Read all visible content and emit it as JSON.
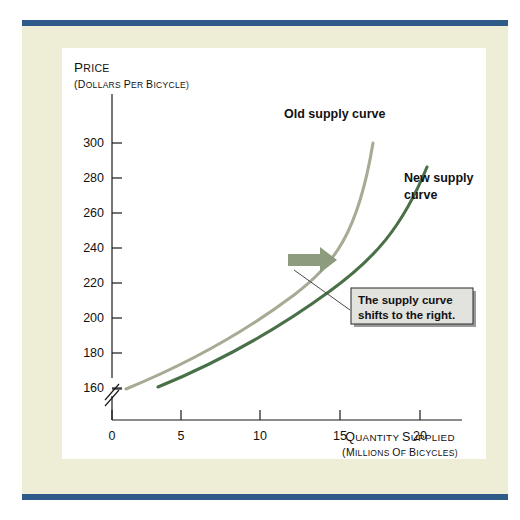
{
  "figure": {
    "accent_bar_color": "#2e5b8a",
    "mat_color": "#eeeed6",
    "panel_color": "#ffffff"
  },
  "chart_data": {
    "type": "line",
    "title": "",
    "xlabel": "Quantity supplied",
    "xlabel_sub": "(millions of bicycles)",
    "ylabel": "Price",
    "ylabel_sub": "(dollars per bicycle)",
    "grid": false,
    "legend_position": "inline-annotations",
    "xlim": [
      0,
      22.5
    ],
    "ylim": [
      130,
      310
    ],
    "y_axis_break": true,
    "xticks": [
      0,
      5,
      10,
      15,
      20
    ],
    "yticks": [
      140,
      160,
      180,
      200,
      220,
      240,
      260,
      280,
      300
    ],
    "xtick_labels": [
      "0",
      "5",
      "10",
      "15",
      "20"
    ],
    "ytick_labels": [
      "140",
      "160",
      "180",
      "200",
      "220",
      "240",
      "260",
      "280",
      "300"
    ],
    "series": [
      {
        "name": "Old supply curve",
        "color": "#a8ab94",
        "label": "Old supply curve",
        "x": [
          1.0,
          3.0,
          5.0,
          7.0,
          9.0,
          11.0,
          13.0,
          15.0,
          16.2,
          17.2
        ],
        "y": [
          140,
          153,
          167,
          182,
          198,
          216,
          238,
          264,
          281,
          300
        ]
      },
      {
        "name": "New supply curve",
        "color": "#4a7048",
        "label_line1": "New supply",
        "label_line2": "curve",
        "x": [
          3.0,
          5.0,
          7.0,
          9.0,
          11.0,
          13.0,
          15.0,
          17.0,
          19.0,
          20.5
        ],
        "y": [
          141,
          152,
          164,
          177,
          192,
          210,
          231,
          254,
          275,
          286
        ]
      }
    ],
    "annotations": [
      {
        "name": "shift-arrow",
        "kind": "arrow",
        "color": "#8d9b7e",
        "direction": "right",
        "at_x": 11.6,
        "at_y": 221
      },
      {
        "name": "shift-callout",
        "kind": "callout",
        "line1": "The supply curve",
        "line2": "shifts to the right.",
        "box_color": "#e2e2de",
        "border_color": "#3a3a3a"
      }
    ]
  }
}
